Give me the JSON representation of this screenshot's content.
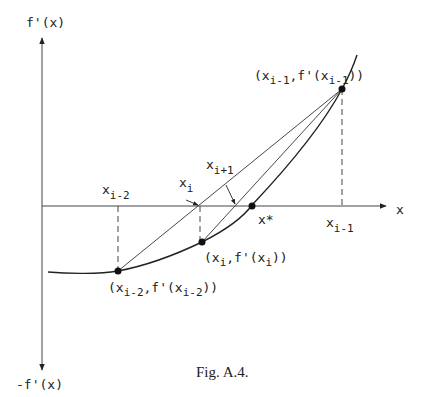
{
  "figure": {
    "caption": "Fig. A.4.",
    "axes": {
      "y_top_label": "f'(x)",
      "y_bottom_label": "-f'(x)",
      "x_label": "x"
    },
    "labels": {
      "x_i_minus_2": {
        "base": "x",
        "sub": "i-2"
      },
      "x_i": {
        "base": "x",
        "sub": "i"
      },
      "x_i_plus_1": {
        "base": "x",
        "sub": "i+1"
      },
      "x_star": "x*",
      "x_i_minus_1": {
        "base": "x",
        "sub": "i-1"
      }
    },
    "points": {
      "p_i_minus_1": {
        "open": "(x",
        "sub1": "i-1",
        "mid": ",f'(x",
        "sub2": "i-1",
        "close": "))"
      },
      "p_i": {
        "open": "(x",
        "sub1": "i",
        "mid": ",f'(x",
        "sub2": "i",
        "close": "))"
      },
      "p_i_minus_2": {
        "open": "(x",
        "sub1": "i-2",
        "mid": ",f'(x",
        "sub2": "i-2",
        "close": "))"
      }
    },
    "colors": {
      "ink": "#222222",
      "background": "#ffffff"
    }
  }
}
